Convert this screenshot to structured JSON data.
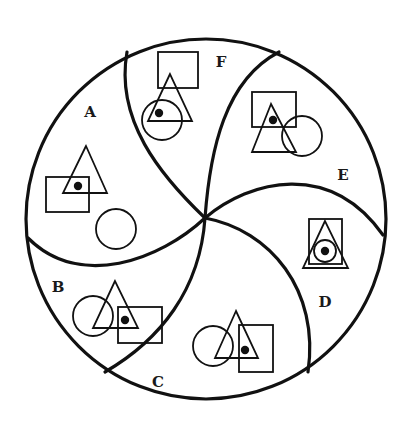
{
  "diagram": {
    "colors": {
      "stroke": "#111111",
      "background": "#ffffff"
    },
    "outer_circle": {
      "cx": 206,
      "cy": 219,
      "r": 180
    },
    "center": {
      "x": 205,
      "y": 218
    },
    "regions": [
      {
        "id": "A",
        "label": "A",
        "label_pos": [
          90,
          117
        ],
        "shapes": {
          "triangle": {
            "apex": [
              86,
              146
            ],
            "base_left": [
              63,
              193
            ],
            "base_right": [
              107,
              193
            ]
          },
          "square": {
            "x": 46,
            "y": 177,
            "w": 43,
            "h": 35
          },
          "circle": {
            "cx": 116,
            "cy": 229,
            "r": 20
          },
          "dot": {
            "cx": 78,
            "cy": 186
          }
        },
        "dot_location": "inside triangle and square"
      },
      {
        "id": "B",
        "label": "B",
        "label_pos": [
          58,
          292
        ],
        "shapes": {
          "triangle": {
            "apex": [
              115,
              281
            ],
            "base_left": [
              93,
              328
            ],
            "base_right": [
              138,
              328
            ]
          },
          "square": {
            "x": 118,
            "y": 307,
            "w": 44,
            "h": 36
          },
          "circle": {
            "cx": 93,
            "cy": 316,
            "r": 20
          },
          "dot": {
            "cx": 125,
            "cy": 320
          }
        },
        "dot_location": "inside triangle and square"
      },
      {
        "id": "C",
        "label": "C",
        "label_pos": [
          158,
          387
        ],
        "shapes": {
          "triangle": {
            "apex": [
              236,
              311
            ],
            "base_left": [
              215,
              358
            ],
            "base_right": [
              258,
              358
            ]
          },
          "square": {
            "x": 239,
            "y": 325,
            "w": 34,
            "h": 47
          },
          "circle": {
            "cx": 213,
            "cy": 346,
            "r": 20
          },
          "dot": {
            "cx": 245,
            "cy": 350
          }
        },
        "dot_location": "inside triangle and square"
      },
      {
        "id": "D",
        "label": "D",
        "label_pos": [
          325,
          307
        ],
        "shapes": {
          "triangle": {
            "apex": [
              325,
              221
            ],
            "base_left": [
              303,
              268
            ],
            "base_right": [
              348,
              268
            ]
          },
          "square": {
            "x": 309,
            "y": 219,
            "w": 33,
            "h": 45
          },
          "circle": {
            "cx": 325,
            "cy": 251,
            "r": 11
          },
          "dot": {
            "cx": 325,
            "cy": 251
          }
        },
        "dot_location": "inside triangle, square and circle"
      },
      {
        "id": "E",
        "label": "E",
        "label_pos": [
          343,
          180
        ],
        "shapes": {
          "triangle": {
            "apex": [
              271,
              104
            ],
            "base_left": [
              252,
              152
            ],
            "base_right": [
              296,
              152
            ]
          },
          "square": {
            "x": 252,
            "y": 92,
            "w": 44,
            "h": 35
          },
          "circle": {
            "cx": 302,
            "cy": 136,
            "r": 20
          },
          "dot": {
            "cx": 273,
            "cy": 120
          }
        },
        "dot_location": "inside triangle and square"
      },
      {
        "id": "F",
        "label": "F",
        "label_pos": [
          221,
          67
        ],
        "shapes": {
          "triangle": {
            "apex": [
              170,
              74
            ],
            "base_left": [
              148,
              121
            ],
            "base_right": [
              192,
              121
            ]
          },
          "square": {
            "x": 158,
            "y": 52,
            "w": 40,
            "h": 36
          },
          "circle": {
            "cx": 162,
            "cy": 120,
            "r": 20
          },
          "dot": {
            "cx": 159,
            "cy": 113
          }
        },
        "dot_location": "inside triangle and circle"
      }
    ],
    "dividers": [
      {
        "name": "divider-top-left",
        "d": "M205 218 C 160 175, 115 120, 127 52"
      },
      {
        "name": "divider-top-right",
        "d": "M205 218 C 210 150, 225 80, 279 52"
      },
      {
        "name": "divider-right",
        "d": "M205 218 C 250 180, 330 160, 383 235"
      },
      {
        "name": "divider-bottom-right",
        "d": "M205 218 C 270 230, 320 290, 308 372"
      },
      {
        "name": "divider-bottom-left",
        "d": "M205 218 C 200 290, 160 340, 105 372"
      },
      {
        "name": "divider-left",
        "d": "M205 218 C 160 260, 80 290, 28 238"
      }
    ]
  }
}
